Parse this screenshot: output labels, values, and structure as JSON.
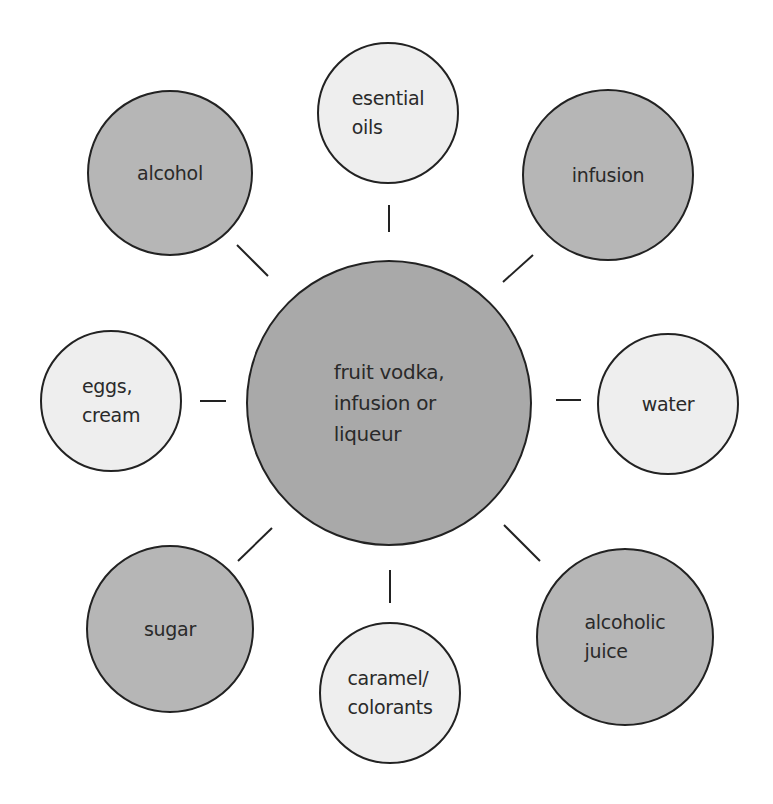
{
  "diagram": {
    "center": {
      "label": "fruit vodka,\ninfusion or\nliqueur",
      "cx": 389,
      "cy": 403,
      "r": 143,
      "tone": "center"
    },
    "nodes": [
      {
        "id": "esential-oils",
        "label": "esential\noils",
        "cx": 388,
        "cy": 113,
        "r": 71,
        "tone": "light"
      },
      {
        "id": "infusion",
        "label": "infusion",
        "cx": 608,
        "cy": 175,
        "r": 86,
        "tone": "dark"
      },
      {
        "id": "water",
        "label": "water",
        "cx": 668,
        "cy": 404,
        "r": 71,
        "tone": "light"
      },
      {
        "id": "alcoholic-juice",
        "label": "alcoholic\njuice",
        "cx": 625,
        "cy": 637,
        "r": 89,
        "tone": "dark"
      },
      {
        "id": "caramel-colorants",
        "label": "caramel/\ncolorants",
        "cx": 390,
        "cy": 693,
        "r": 71,
        "tone": "light"
      },
      {
        "id": "sugar",
        "label": "sugar",
        "cx": 170,
        "cy": 629,
        "r": 84,
        "tone": "dark"
      },
      {
        "id": "eggs-cream",
        "label": "eggs,\ncream",
        "cx": 111,
        "cy": 401,
        "r": 71,
        "tone": "light"
      },
      {
        "id": "alcohol",
        "label": "alcohol",
        "cx": 170,
        "cy": 173,
        "r": 83,
        "tone": "dark"
      }
    ],
    "connectors": [
      {
        "to": "esential-oils",
        "x1": 389,
        "y1": 205,
        "x2": 389,
        "y2": 232
      },
      {
        "to": "infusion",
        "x1": 533,
        "y1": 255,
        "x2": 503,
        "y2": 282
      },
      {
        "to": "water",
        "x1": 556,
        "y1": 400,
        "x2": 581,
        "y2": 400
      },
      {
        "to": "alcoholic-juice",
        "x1": 504,
        "y1": 525,
        "x2": 540,
        "y2": 561
      },
      {
        "to": "caramel-colorants",
        "x1": 390,
        "y1": 570,
        "x2": 390,
        "y2": 603
      },
      {
        "to": "sugar",
        "x1": 272,
        "y1": 528,
        "x2": 238,
        "y2": 561
      },
      {
        "to": "eggs-cream",
        "x1": 200,
        "y1": 401,
        "x2": 226,
        "y2": 401
      },
      {
        "to": "alcohol",
        "x1": 237,
        "y1": 245,
        "x2": 268,
        "y2": 276
      }
    ],
    "colors": {
      "dark_fill": "#b6b6b6",
      "center_fill": "#a9a9a9",
      "light_fill": "#eeeeee",
      "stroke": "#222222",
      "text": "#2a2a2a"
    }
  }
}
